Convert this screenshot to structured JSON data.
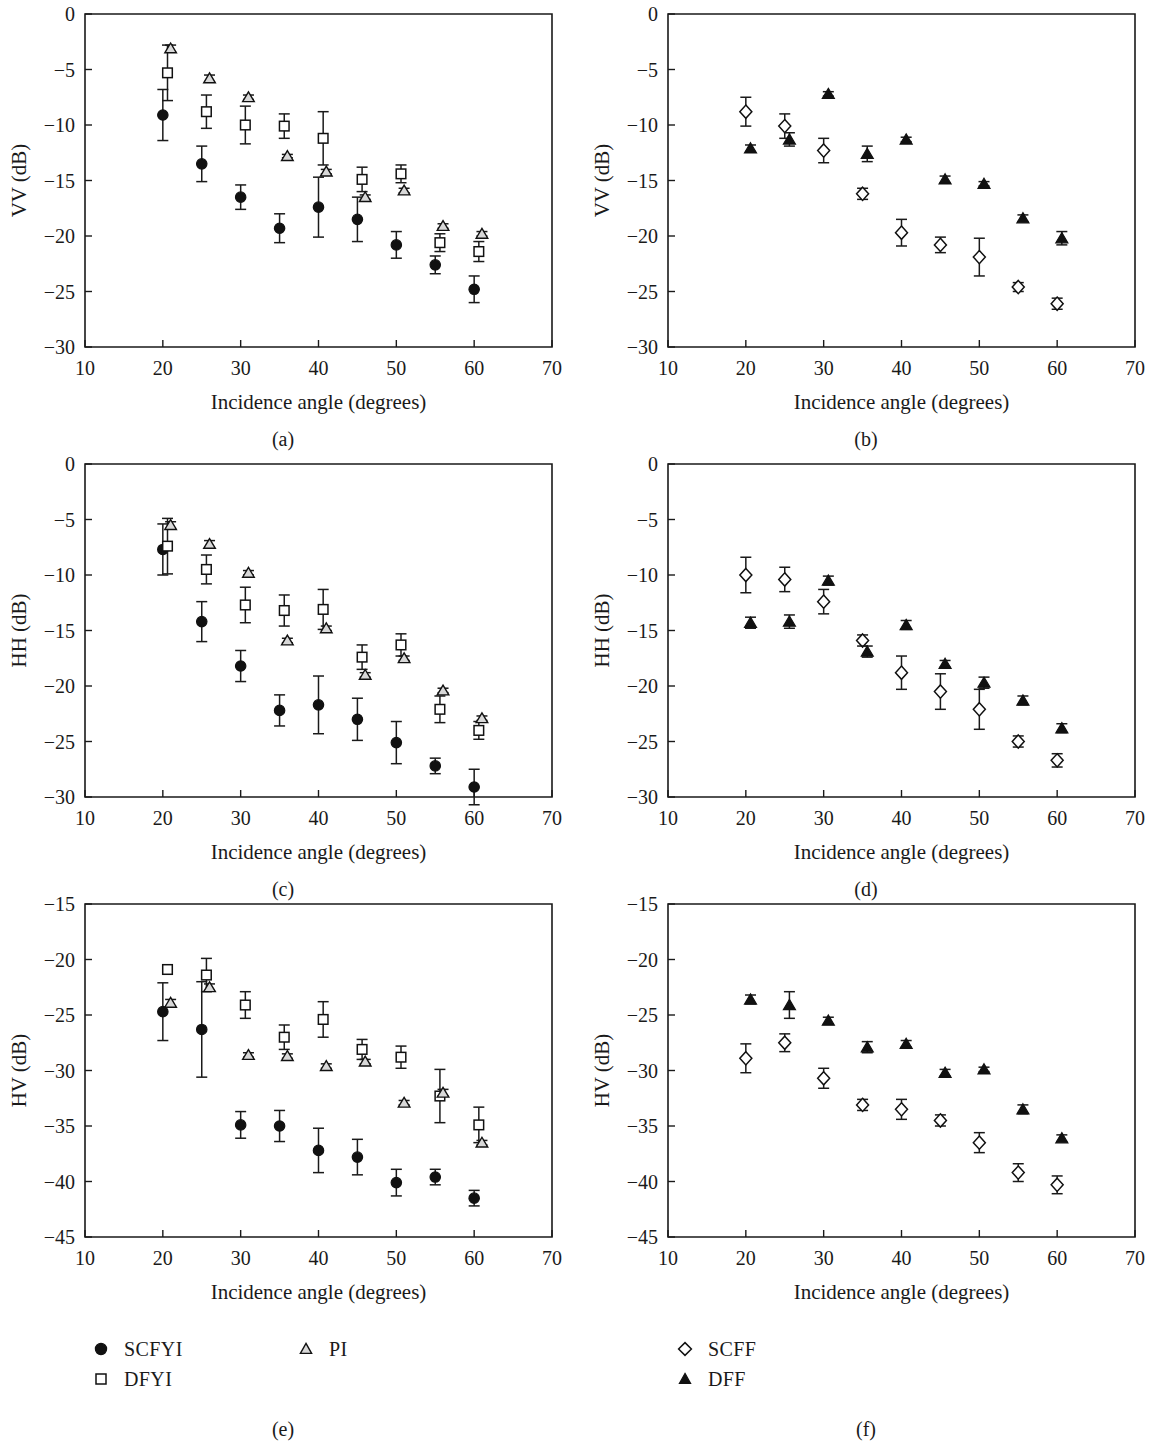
{
  "figure": {
    "panel_captions": [
      "(a)",
      "(b)",
      "(c)",
      "(d)",
      "(e)",
      "(f)"
    ],
    "xlabel": "Incidence angle (degrees)",
    "ylabels": [
      "VV (dB)",
      "HH (dB)",
      "HV (dB)"
    ]
  },
  "legend": {
    "left": [
      {
        "symbol": "filled-circle",
        "label": "SCFYI"
      },
      {
        "symbol": "open-square",
        "label": "DFYI"
      },
      {
        "symbol": "open-triangle",
        "label": "PI"
      }
    ],
    "right": [
      {
        "symbol": "open-diamond",
        "label": "SCFF"
      },
      {
        "symbol": "filled-triangle",
        "label": "DFF"
      }
    ]
  },
  "colors": {
    "ink": "#111111",
    "frame": "#1a1a1a",
    "open_fill": "#ffffff",
    "triangle_fill": "#d8d8d8"
  },
  "chart_data": [
    {
      "panel": "(a)",
      "type": "scatter",
      "title": "",
      "xlabel": "Incidence angle (degrees)",
      "ylabel": "VV (dB)",
      "xlim": [
        10,
        70
      ],
      "ylim": [
        -30,
        0
      ],
      "xticks": [
        10,
        20,
        30,
        40,
        50,
        60,
        70
      ],
      "yticks": [
        0,
        -5,
        -10,
        -15,
        -20,
        -25,
        -30
      ],
      "grid": false,
      "legend_position": "external-bottom",
      "series": [
        {
          "name": "SCFYI",
          "marker": "filled-circle",
          "x": [
            20,
            25,
            30,
            35,
            40,
            45,
            50,
            55,
            60
          ],
          "values": [
            -9.1,
            -13.5,
            -16.5,
            -19.3,
            -17.4,
            -18.5,
            -20.8,
            -22.6,
            -24.8
          ],
          "yerr": [
            2.3,
            1.6,
            1.1,
            1.3,
            2.7,
            2.0,
            1.2,
            0.8,
            1.2
          ]
        },
        {
          "name": "DFYI",
          "marker": "open-square",
          "x": [
            20.6,
            25.6,
            30.6,
            35.6,
            40.6,
            45.6,
            50.6,
            55.6,
            60.6
          ],
          "values": [
            -5.3,
            -8.8,
            -10.0,
            -10.1,
            -11.2,
            -14.9,
            -14.4,
            -20.6,
            -21.4
          ],
          "yerr": [
            2.5,
            1.5,
            1.7,
            1.1,
            2.4,
            1.1,
            0.8,
            0.8,
            0.9
          ]
        },
        {
          "name": "PI",
          "marker": "open-triangle",
          "x": [
            21.0,
            26.0,
            31.0,
            36.0,
            41.0,
            46.0,
            51.0,
            56.0,
            61.0
          ],
          "values": [
            -3.1,
            -5.8,
            -7.5,
            -12.8,
            -14.2,
            -16.5,
            -15.9,
            -19.1,
            -19.8
          ],
          "yerr": [
            0.3,
            0.3,
            0.2,
            0.15,
            0.2,
            0.2,
            0.2,
            0.2,
            0.2
          ]
        }
      ]
    },
    {
      "panel": "(b)",
      "type": "scatter",
      "title": "",
      "xlabel": "Incidence angle (degrees)",
      "ylabel": "VV (dB)",
      "xlim": [
        10,
        70
      ],
      "ylim": [
        -30,
        0
      ],
      "xticks": [
        10,
        20,
        30,
        40,
        50,
        60,
        70
      ],
      "yticks": [
        0,
        -5,
        -10,
        -15,
        -20,
        -25,
        -30
      ],
      "grid": false,
      "legend_position": "external-bottom",
      "series": [
        {
          "name": "SCFF",
          "marker": "open-diamond",
          "x": [
            20,
            25,
            30,
            35,
            40,
            45,
            50,
            55,
            60
          ],
          "values": [
            -8.8,
            -10.1,
            -12.3,
            -16.2,
            -19.7,
            -20.8,
            -21.9,
            -24.6,
            -26.1
          ],
          "yerr": [
            1.3,
            1.1,
            1.1,
            0.5,
            1.2,
            0.7,
            1.7,
            0.4,
            0.5
          ]
        },
        {
          "name": "DFF",
          "marker": "filled-triangle",
          "x": [
            20.6,
            25.6,
            30.6,
            35.6,
            40.6,
            45.6,
            50.6,
            55.6,
            60.6
          ],
          "values": [
            -12.1,
            -11.3,
            -7.2,
            -12.6,
            -11.3,
            -14.9,
            -15.3,
            -18.4,
            -20.2
          ],
          "yerr": [
            0.3,
            0.6,
            0.2,
            0.7,
            0.2,
            0.3,
            0.2,
            0.3,
            0.6
          ]
        }
      ]
    },
    {
      "panel": "(c)",
      "type": "scatter",
      "title": "",
      "xlabel": "Incidence angle (degrees)",
      "ylabel": "HH (dB)",
      "xlim": [
        10,
        70
      ],
      "ylim": [
        -30,
        0
      ],
      "xticks": [
        10,
        20,
        30,
        40,
        50,
        60,
        70
      ],
      "yticks": [
        0,
        -5,
        -10,
        -15,
        -20,
        -25,
        -30
      ],
      "grid": false,
      "legend_position": "external-bottom",
      "series": [
        {
          "name": "SCFYI",
          "marker": "filled-circle",
          "x": [
            20,
            25,
            30,
            35,
            40,
            45,
            50,
            55,
            60
          ],
          "values": [
            -7.7,
            -14.2,
            -18.2,
            -22.2,
            -21.7,
            -23.0,
            -25.1,
            -27.2,
            -29.1
          ],
          "yerr": [
            2.3,
            1.8,
            1.4,
            1.4,
            2.6,
            1.9,
            1.9,
            0.7,
            1.6
          ]
        },
        {
          "name": "DFYI",
          "marker": "open-square",
          "x": [
            20.6,
            25.6,
            30.6,
            35.6,
            40.6,
            45.6,
            50.6,
            55.6,
            60.6
          ],
          "values": [
            -7.4,
            -9.5,
            -12.7,
            -13.2,
            -13.1,
            -17.4,
            -16.3,
            -22.1,
            -24.0
          ],
          "yerr": [
            2.5,
            1.3,
            1.6,
            1.4,
            1.8,
            1.1,
            1.0,
            1.2,
            0.8
          ]
        },
        {
          "name": "PI",
          "marker": "open-triangle",
          "x": [
            21.0,
            26.0,
            31.0,
            36.0,
            41.0,
            46.0,
            51.0,
            56.0,
            61.0
          ],
          "values": [
            -5.5,
            -7.2,
            -9.8,
            -15.9,
            -14.8,
            -19.0,
            -17.5,
            -20.4,
            -22.9
          ],
          "yerr": [
            0.3,
            0.3,
            0.2,
            0.2,
            0.2,
            0.2,
            0.2,
            0.2,
            0.2
          ]
        }
      ]
    },
    {
      "panel": "(d)",
      "type": "scatter",
      "title": "",
      "xlabel": "Incidence angle (degrees)",
      "ylabel": "HH (dB)",
      "xlim": [
        10,
        70
      ],
      "ylim": [
        -30,
        0
      ],
      "xticks": [
        10,
        20,
        30,
        40,
        50,
        60,
        70
      ],
      "yticks": [
        0,
        -5,
        -10,
        -15,
        -20,
        -25,
        -30
      ],
      "grid": false,
      "legend_position": "external-bottom",
      "series": [
        {
          "name": "SCFF",
          "marker": "open-diamond",
          "x": [
            20,
            25,
            30,
            35,
            40,
            45,
            50,
            55,
            60
          ],
          "values": [
            -10.0,
            -10.4,
            -12.4,
            -15.9,
            -18.8,
            -20.5,
            -22.1,
            -25.0,
            -26.7
          ],
          "yerr": [
            1.6,
            1.1,
            1.1,
            0.5,
            1.5,
            1.6,
            1.8,
            0.5,
            0.6
          ]
        },
        {
          "name": "DFF",
          "marker": "filled-triangle",
          "x": [
            20.6,
            25.6,
            30.6,
            35.6,
            40.6,
            45.6,
            50.6,
            55.6,
            60.6
          ],
          "values": [
            -14.3,
            -14.2,
            -10.5,
            -16.9,
            -14.5,
            -18.0,
            -19.7,
            -21.3,
            -23.8
          ],
          "yerr": [
            0.5,
            0.6,
            0.4,
            0.5,
            0.4,
            0.3,
            0.5,
            0.4,
            0.4
          ]
        }
      ]
    },
    {
      "panel": "(e)",
      "type": "scatter",
      "title": "",
      "xlabel": "Incidence angle (degrees)",
      "ylabel": "HV (dB)",
      "xlim": [
        10,
        70
      ],
      "ylim": [
        -45,
        -15
      ],
      "xticks": [
        10,
        20,
        30,
        40,
        50,
        60,
        70
      ],
      "yticks": [
        -15,
        -20,
        -25,
        -30,
        -35,
        -40,
        -45
      ],
      "grid": false,
      "legend_position": "external-bottom",
      "series": [
        {
          "name": "SCFYI",
          "marker": "filled-circle",
          "x": [
            20,
            25,
            30,
            35,
            40,
            45,
            50,
            55,
            60
          ],
          "values": [
            -24.7,
            -26.3,
            -34.9,
            -35.0,
            -37.2,
            -37.8,
            -40.1,
            -39.6,
            -41.5
          ],
          "yerr": [
            2.6,
            4.3,
            1.2,
            1.4,
            2.0,
            1.6,
            1.2,
            0.7,
            0.7
          ]
        },
        {
          "name": "DFYI",
          "marker": "open-square",
          "x": [
            20.6,
            25.6,
            30.6,
            35.6,
            40.6,
            45.6,
            50.6,
            55.6,
            60.6
          ],
          "values": [
            -20.9,
            -21.4,
            -24.1,
            -27.0,
            -25.4,
            -28.1,
            -28.8,
            -32.3,
            -34.9
          ],
          "yerr": [
            0.4,
            1.5,
            1.2,
            1.1,
            1.6,
            0.9,
            1.0,
            2.4,
            1.6
          ]
        },
        {
          "name": "PI",
          "marker": "open-triangle",
          "x": [
            21.0,
            26.0,
            31.0,
            36.0,
            41.0,
            46.0,
            51.0,
            56.0,
            61.0
          ],
          "values": [
            -23.9,
            -22.5,
            -28.6,
            -28.7,
            -29.6,
            -29.2,
            -32.9,
            -32.0,
            -36.5
          ],
          "yerr": [
            0.3,
            0.3,
            0.2,
            0.2,
            0.2,
            0.2,
            0.2,
            0.3,
            0.2
          ]
        }
      ]
    },
    {
      "panel": "(f)",
      "type": "scatter",
      "title": "",
      "xlabel": "Incidence angle (degrees)",
      "ylabel": "HV (dB)",
      "xlim": [
        10,
        70
      ],
      "ylim": [
        -45,
        -15
      ],
      "xticks": [
        10,
        20,
        30,
        40,
        50,
        60,
        70
      ],
      "yticks": [
        -15,
        -20,
        -25,
        -30,
        -35,
        -40,
        -45
      ],
      "grid": false,
      "legend_position": "external-bottom",
      "series": [
        {
          "name": "SCFF",
          "marker": "open-diamond",
          "x": [
            20,
            25,
            30,
            35,
            40,
            45,
            50,
            55,
            60
          ],
          "values": [
            -28.9,
            -27.5,
            -30.7,
            -33.1,
            -33.5,
            -34.5,
            -36.5,
            -39.2,
            -40.3
          ],
          "yerr": [
            1.3,
            0.8,
            0.9,
            0.5,
            0.9,
            0.5,
            0.9,
            0.8,
            0.8
          ]
        },
        {
          "name": "DFF",
          "marker": "filled-triangle",
          "x": [
            20.6,
            25.6,
            30.6,
            35.6,
            40.6,
            45.6,
            50.6,
            55.6,
            60.6
          ],
          "values": [
            -23.6,
            -24.1,
            -25.5,
            -27.9,
            -27.6,
            -30.2,
            -29.9,
            -33.5,
            -36.1
          ],
          "yerr": [
            0.4,
            1.2,
            0.3,
            0.5,
            0.3,
            0.3,
            0.2,
            0.4,
            0.3
          ]
        }
      ]
    }
  ]
}
